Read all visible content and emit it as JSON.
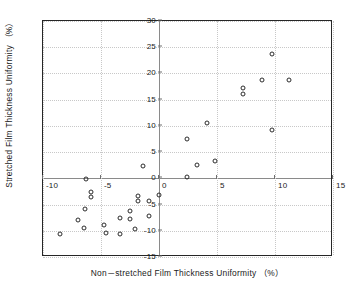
{
  "chart_data": {
    "type": "scatter",
    "title": "",
    "xlabel": "Non－stretched Film Thickness Uniformity （%）",
    "ylabel": "Stretched Film Thickness Uniformity （%）",
    "xlim": [
      -10,
      15
    ],
    "ylim": [
      -15,
      30
    ],
    "xticks": [
      -10,
      -5,
      0,
      5,
      10,
      15
    ],
    "xticklabels": [
      "-10",
      "-5",
      "0",
      "5",
      "10",
      "15"
    ],
    "yticks": [
      -15,
      -10,
      -5,
      0,
      5,
      10,
      15,
      20,
      25,
      30
    ],
    "yticklabels": [
      "-15",
      "-10",
      "-5",
      "0",
      "5",
      "10",
      "15",
      "20",
      "25",
      "30"
    ],
    "grid": true,
    "legend": false,
    "marker": "open-circle",
    "marker_color": "#2b2b2b",
    "grid_color": "#c8c8c8",
    "frame_color": "#262626",
    "points": [
      {
        "x": 9.7,
        "y": 23.7
      },
      {
        "x": 8.9,
        "y": 18.7
      },
      {
        "x": 11.2,
        "y": 18.7
      },
      {
        "x": 7.2,
        "y": 17.3
      },
      {
        "x": 7.2,
        "y": 16.1
      },
      {
        "x": 9.7,
        "y": 9.2
      },
      {
        "x": 4.1,
        "y": 10.6
      },
      {
        "x": 2.4,
        "y": 7.5
      },
      {
        "x": 4.8,
        "y": 3.3
      },
      {
        "x": 3.3,
        "y": 2.5
      },
      {
        "x": -1.4,
        "y": 2.4
      },
      {
        "x": 2.4,
        "y": 0.2
      },
      {
        "x": -6.3,
        "y": -0.2
      },
      {
        "x": -5.9,
        "y": -2.6
      },
      {
        "x": -5.9,
        "y": -3.6
      },
      {
        "x": -1.8,
        "y": -3.3
      },
      {
        "x": -1.8,
        "y": -4.4
      },
      {
        "x": 0.0,
        "y": -3.2
      },
      {
        "x": -0.9,
        "y": -4.4
      },
      {
        "x": -6.4,
        "y": -5.9
      },
      {
        "x": -2.5,
        "y": -6.3
      },
      {
        "x": -0.9,
        "y": -7.2
      },
      {
        "x": -7.0,
        "y": -7.9
      },
      {
        "x": -3.4,
        "y": -7.6
      },
      {
        "x": -2.5,
        "y": -7.7
      },
      {
        "x": -6.5,
        "y": -9.4
      },
      {
        "x": -4.7,
        "y": -8.9
      },
      {
        "x": -2.1,
        "y": -9.6
      },
      {
        "x": -8.5,
        "y": -10.6
      },
      {
        "x": -4.6,
        "y": -10.5
      },
      {
        "x": -3.4,
        "y": -10.6
      }
    ]
  }
}
